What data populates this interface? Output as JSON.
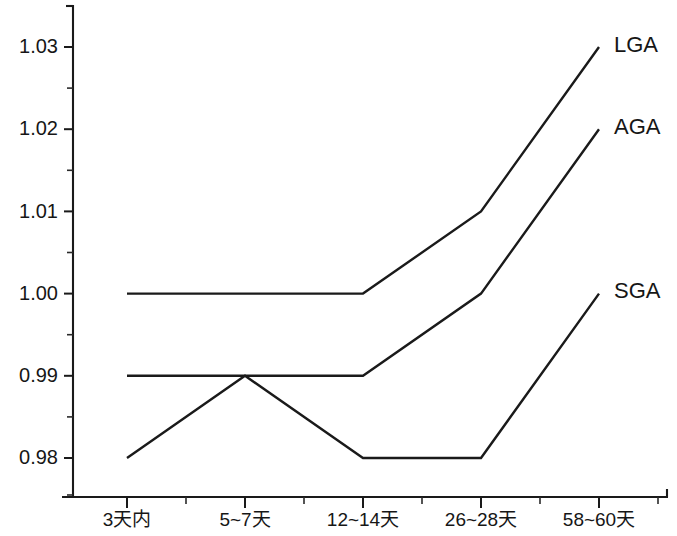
{
  "chart_data": {
    "type": "line",
    "title": "",
    "xlabel": "",
    "ylabel": "",
    "categories": [
      "3天内",
      "5~7天",
      "12~14天",
      "26~28天",
      "58~60天"
    ],
    "series": [
      {
        "name": "LGA",
        "values": [
          1.0,
          1.0,
          1.0,
          1.01,
          1.03
        ]
      },
      {
        "name": "AGA",
        "values": [
          0.99,
          0.99,
          0.99,
          1.0,
          1.02
        ]
      },
      {
        "name": "SGA",
        "values": [
          0.98,
          0.99,
          0.98,
          0.98,
          1.0
        ]
      }
    ],
    "ylim": [
      0.9755,
      1.0335
    ],
    "ytick_labels": [
      "1.03",
      "1.02",
      "1.01",
      "1.00",
      "0.99",
      "0.98"
    ],
    "ytick_values": [
      1.03,
      1.02,
      1.01,
      1.0,
      0.99,
      0.98
    ],
    "yminor_values": [
      1.025,
      1.015,
      1.005,
      0.995,
      0.985,
      0.9755
    ],
    "grid": false,
    "legend_position": "right-inline",
    "line_color": "#1a1a1a",
    "axis_color": "#1a1a1a",
    "background": "#ffffff",
    "series_label_positions": [
      {
        "name": "LGA",
        "value": 1.03
      },
      {
        "name": "AGA",
        "value": 1.02
      },
      {
        "name": "SGA",
        "value": 1.0
      }
    ]
  }
}
